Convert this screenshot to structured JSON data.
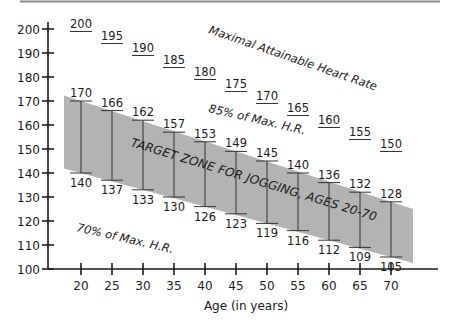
{
  "chart_data": {
    "type": "area",
    "title": "",
    "xlabel": "Age (in years)",
    "ylabel": "",
    "xlim": [
      17,
      77
    ],
    "ylim": [
      100,
      200
    ],
    "x_ticks": [
      20,
      25,
      30,
      35,
      40,
      45,
      50,
      55,
      60,
      65,
      70
    ],
    "y_ticks": [
      100,
      110,
      120,
      130,
      140,
      150,
      160,
      170,
      180,
      190,
      200
    ],
    "grid": false,
    "series": [
      {
        "name": "Maximal Attainable Heart Rate",
        "x": [
          20,
          25,
          30,
          35,
          40,
          45,
          50,
          55,
          60,
          65,
          70
        ],
        "values": [
          200,
          195,
          190,
          185,
          180,
          175,
          170,
          165,
          160,
          155,
          150
        ]
      },
      {
        "name": "85% of Max. H.R.",
        "x": [
          20,
          25,
          30,
          35,
          40,
          45,
          50,
          55,
          60,
          65,
          70
        ],
        "values": [
          170,
          166,
          162,
          157,
          153,
          149,
          145,
          140,
          136,
          132,
          128
        ]
      },
      {
        "name": "70% of Max. H.R.",
        "x": [
          20,
          25,
          30,
          35,
          40,
          45,
          50,
          55,
          60,
          65,
          70
        ],
        "values": [
          140,
          137,
          133,
          130,
          126,
          123,
          119,
          116,
          112,
          109,
          105
        ]
      }
    ],
    "annotations": {
      "max_label": "Maximal Attainable Heart Rate",
      "upper_label": "85% of Max. H.R.",
      "lower_label": "70% of Max. H.R.",
      "zone_label": "TARGET ZONE FOR JOGGING, AGES 20-70"
    },
    "colors": {
      "zone": "#b3b3b3",
      "axis": "#1a1a1a",
      "text": "#1a1a1a",
      "rule": "#888888"
    }
  }
}
